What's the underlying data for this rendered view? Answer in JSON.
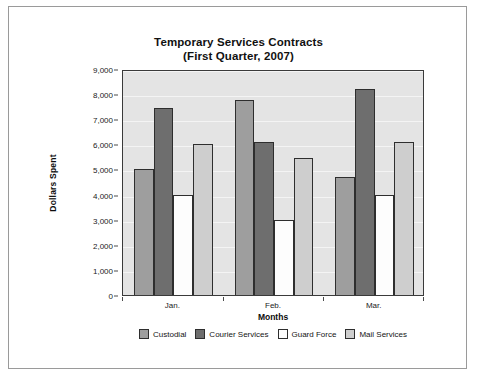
{
  "chart_data": {
    "type": "bar",
    "title": "Temporary Services Contracts",
    "subtitle": "(First Quarter, 2007)",
    "xlabel": "Months",
    "ylabel": "Dollars Spent",
    "categories": [
      "Jan.",
      "Feb.",
      "Mar."
    ],
    "series": [
      {
        "name": "Custodial",
        "color": "#9e9e9e",
        "values": [
          5000,
          7750,
          4700
        ]
      },
      {
        "name": "Courier Services",
        "color": "#6e6e6e",
        "values": [
          7450,
          6100,
          8200
        ]
      },
      {
        "name": "Guard Force",
        "color": "#fdfdfd",
        "values": [
          4000,
          3000,
          4000
        ]
      },
      {
        "name": "Mail Services",
        "color": "#cecece",
        "values": [
          6000,
          5450,
          6100
        ]
      }
    ],
    "ylim": [
      0,
      9000
    ],
    "ytick_values": [
      0,
      1000,
      2000,
      3000,
      4000,
      5000,
      6000,
      7000,
      8000,
      9000
    ],
    "ytick_labels": [
      "0",
      "1,000",
      "2,000",
      "3,000",
      "4,000",
      "5,000",
      "6,000",
      "7,000",
      "8,000",
      "9,000"
    ],
    "grid": true,
    "legend_position": "bottom",
    "plot_background": "#e4e4e4",
    "gridline_color": "#f4f4f4",
    "bar_edge_color": "#2e2e2e"
  }
}
